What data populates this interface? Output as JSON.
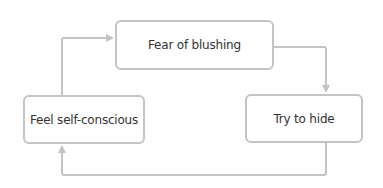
{
  "diagram": {
    "type": "cycle",
    "nodes": [
      {
        "id": "fear",
        "label": "Fear of blushing"
      },
      {
        "id": "hide",
        "label": "Try to hide"
      },
      {
        "id": "selfconscious",
        "label": "Feel self-conscious"
      }
    ],
    "edges": [
      {
        "from": "fear",
        "to": "hide"
      },
      {
        "from": "hide",
        "to": "selfconscious"
      },
      {
        "from": "selfconscious",
        "to": "fear"
      }
    ],
    "colors": {
      "stroke": "#c4c4c4",
      "text": "#333333",
      "background": "#ffffff"
    }
  }
}
